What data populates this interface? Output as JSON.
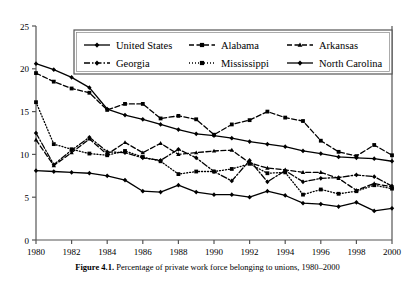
{
  "caption": {
    "number": "Figure 4.1.",
    "text": "Percentage of private work force belonging to unions, 1980–2000"
  },
  "chart_data": {
    "type": "line",
    "title": "",
    "xlabel": "",
    "ylabel": "",
    "xlim": [
      1980,
      2000
    ],
    "ylim": [
      0,
      25
    ],
    "yticks": [
      0,
      5,
      10,
      15,
      20,
      25
    ],
    "ytick_labels": [
      "0",
      "5",
      "10",
      "15",
      "20",
      "25"
    ],
    "xticks": [
      1980,
      1982,
      1984,
      1986,
      1988,
      1990,
      1992,
      1994,
      1996,
      1998,
      2000
    ],
    "xtick_labels": [
      "1980",
      "1982",
      "1984",
      "1986",
      "1988",
      "1990",
      "1992",
      "1994",
      "1996",
      "1998",
      "2000"
    ],
    "x": [
      1980,
      1981,
      1982,
      1983,
      1984,
      1985,
      1986,
      1987,
      1988,
      1989,
      1990,
      1991,
      1992,
      1993,
      1994,
      1995,
      1996,
      1997,
      1998,
      1999,
      2000
    ],
    "grid": false,
    "legend_position": "top-center",
    "series": [
      {
        "name": "United States",
        "line_style": "solid",
        "marker": "diamond",
        "color": "#000000",
        "values": [
          8.1,
          8.0,
          7.9,
          7.8,
          7.5,
          7.0,
          5.7,
          5.6,
          6.4,
          5.6,
          5.3,
          5.3,
          5.0,
          5.7,
          5.2,
          4.3,
          4.2,
          3.9,
          4.4,
          3.4,
          3.7
        ]
      },
      {
        "name": "Alabama",
        "line_style": "dashed",
        "marker": "square",
        "color": "#000000",
        "values": [
          19.5,
          18.5,
          17.7,
          17.2,
          15.2,
          15.9,
          15.9,
          14.2,
          14.5,
          14.1,
          12.3,
          13.5,
          14.0,
          15.0,
          14.3,
          13.9,
          11.6,
          10.3,
          9.8,
          11.1,
          9.9
        ]
      },
      {
        "name": "Arkansas",
        "line_style": "dashed",
        "marker": "triangle",
        "color": "#000000",
        "values": [
          11.7,
          8.7,
          10.2,
          11.8,
          10.0,
          11.4,
          10.2,
          11.3,
          10.0,
          10.2,
          10.4,
          10.5,
          9.0,
          8.4,
          8.2,
          7.9,
          7.9,
          7.2,
          5.8,
          6.6,
          6.2
        ]
      },
      {
        "name": "Georgia",
        "line_style": "dashdot",
        "marker": "diamond",
        "color": "#000000",
        "values": [
          12.5,
          8.8,
          10.5,
          12.0,
          10.3,
          10.2,
          9.6,
          9.3,
          10.6,
          9.6,
          8.0,
          6.9,
          9.3,
          6.8,
          8.1,
          6.8,
          7.2,
          7.3,
          7.6,
          7.4,
          6.3
        ]
      },
      {
        "name": "Mississippi",
        "line_style": "dotted",
        "marker": "square",
        "color": "#000000",
        "values": [
          16.1,
          11.2,
          10.6,
          10.1,
          9.9,
          10.4,
          9.7,
          9.2,
          7.7,
          8.0,
          8.0,
          8.3,
          8.9,
          7.8,
          7.9,
          5.3,
          5.9,
          5.4,
          5.7,
          6.4,
          6.0
        ]
      },
      {
        "name": "North Carolina",
        "line_style": "solid",
        "marker": "diamond",
        "color": "#000000",
        "values": [
          20.6,
          19.9,
          19.0,
          17.8,
          15.3,
          14.6,
          14.1,
          13.5,
          12.9,
          12.4,
          12.2,
          11.9,
          11.5,
          11.2,
          10.9,
          10.4,
          10.1,
          9.7,
          9.6,
          9.5,
          9.2
        ]
      }
    ]
  }
}
